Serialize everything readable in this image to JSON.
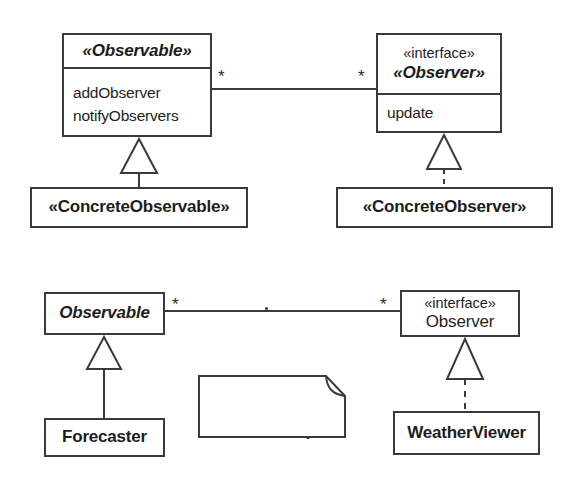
{
  "diagram": {
    "colors": {
      "line": "#3a3a3a",
      "text": "#1d1d1d",
      "background": "#ffffff"
    },
    "top_diagram": {
      "observable_class": {
        "name": "«Observable»",
        "members": [
          "addObserver",
          "notifyObservers"
        ]
      },
      "observer_interface": {
        "stereotype": "«interface»",
        "name": "«Observer»",
        "members": [
          "update"
        ]
      },
      "concrete_observable": {
        "name": "«ConcreteObservable»"
      },
      "concrete_observer": {
        "name": "«ConcreteObserver»"
      },
      "association": {
        "source_multiplicity": "*",
        "target_multiplicity": "*"
      }
    },
    "bottom_diagram": {
      "observable_class": {
        "name": "Observable"
      },
      "observer_interface": {
        "stereotype": "«interface»",
        "name": "Observer"
      },
      "forecaster": {
        "name": "Forecaster"
      },
      "weather_viewer": {
        "name": "WeatherViewer"
      },
      "association": {
        "source_multiplicity": "*",
        "target_multiplicity": "*",
        "marker": "."
      },
      "note": {
        "lines": [
          "Observers are",
          "notified when a new",
          "forecast is ready"
        ]
      }
    }
  }
}
